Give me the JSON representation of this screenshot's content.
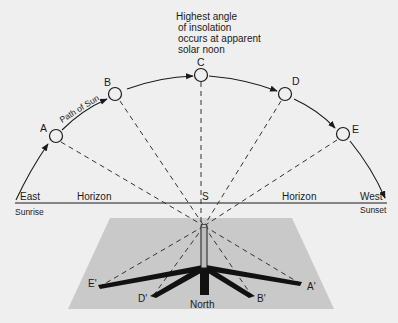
{
  "diagram": {
    "title_note": [
      "Highest angle",
      "of insolation",
      "occurs at apparent",
      "solar noon"
    ],
    "path_label": "Path of Sun",
    "sun_positions": [
      "A",
      "B",
      "C",
      "D",
      "E"
    ],
    "shadow_tips": [
      "A'",
      "B'",
      "D'",
      "E'"
    ],
    "center_label": "S",
    "east": "East",
    "west": "West",
    "sunrise": "Sunrise",
    "sunset": "Sunset",
    "horizon_left": "Horizon",
    "horizon_right": "Horizon",
    "north": "North",
    "colors": {
      "background": "#efefef",
      "ground": "#c9c9c9",
      "ink": "#1a1a1a"
    }
  }
}
